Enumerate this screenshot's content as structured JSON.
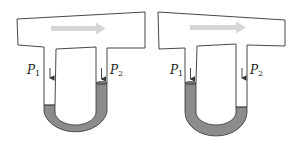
{
  "figure": {
    "colors": {
      "outline": "#333333",
      "fluid": "#8c8c8c",
      "flow_arrow": "#d0d0d0",
      "background": "#ffffff"
    },
    "panels": [
      {
        "id": "left",
        "labels": {
          "p1": "P",
          "p1_sub": "1",
          "p2": "P",
          "p2_sub": "2"
        },
        "fluid_higher_side": "right"
      },
      {
        "id": "right",
        "labels": {
          "p1": "P",
          "p1_sub": "1",
          "p2": "P",
          "p2_sub": "2"
        },
        "fluid_higher_side": "left"
      }
    ]
  }
}
